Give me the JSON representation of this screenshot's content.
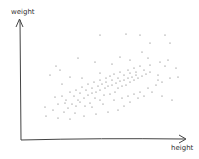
{
  "chart_data": {
    "type": "scatter",
    "title": "",
    "xlabel": "height",
    "ylabel": "weight",
    "grid": false,
    "legend": null,
    "style": "hand-drawn sketch",
    "trend": "positive correlation",
    "points": [
      [
        60,
        70
      ],
      [
        70,
        77
      ],
      [
        62,
        84
      ],
      [
        50,
        75
      ],
      [
        82,
        78
      ],
      [
        100,
        73
      ],
      [
        120,
        57
      ],
      [
        142,
        52
      ],
      [
        158,
        75
      ],
      [
        158,
        80
      ],
      [
        178,
        77
      ],
      [
        140,
        35
      ],
      [
        165,
        35
      ],
      [
        126,
        34
      ],
      [
        150,
        43
      ],
      [
        170,
        43
      ],
      [
        100,
        35
      ],
      [
        45,
        107
      ],
      [
        53,
        110
      ],
      [
        64,
        112
      ],
      [
        75,
        113
      ],
      [
        68,
        108
      ],
      [
        80,
        102
      ],
      [
        85,
        106
      ],
      [
        90,
        103
      ],
      [
        95,
        98
      ],
      [
        100,
        100
      ],
      [
        104,
        95
      ],
      [
        110,
        94
      ],
      [
        115,
        92
      ],
      [
        118,
        88
      ],
      [
        122,
        86
      ],
      [
        126,
        85
      ],
      [
        130,
        82
      ],
      [
        134,
        80
      ],
      [
        138,
        78
      ],
      [
        142,
        76
      ],
      [
        146,
        74
      ],
      [
        150,
        72
      ],
      [
        72,
        104
      ],
      [
        78,
        100
      ],
      [
        84,
        98
      ],
      [
        88,
        95
      ],
      [
        92,
        93
      ],
      [
        96,
        92
      ],
      [
        100,
        90
      ],
      [
        105,
        88
      ],
      [
        108,
        86
      ],
      [
        112,
        85
      ],
      [
        116,
        83
      ],
      [
        120,
        81
      ],
      [
        124,
        80
      ],
      [
        128,
        78
      ],
      [
        132,
        77
      ],
      [
        136,
        75
      ],
      [
        66,
        100
      ],
      [
        74,
        96
      ],
      [
        80,
        93
      ],
      [
        86,
        90
      ],
      [
        92,
        88
      ],
      [
        98,
        86
      ],
      [
        102,
        84
      ],
      [
        106,
        82
      ],
      [
        112,
        80
      ],
      [
        118,
        78
      ],
      [
        124,
        75
      ],
      [
        130,
        73
      ],
      [
        136,
        72
      ],
      [
        144,
        70
      ],
      [
        58,
        104
      ],
      [
        62,
        96
      ],
      [
        70,
        92
      ],
      [
        76,
        90
      ],
      [
        82,
        87
      ],
      [
        88,
        84
      ],
      [
        94,
        82
      ],
      [
        100,
        80
      ],
      [
        106,
        78
      ],
      [
        110,
        76
      ],
      [
        114,
        74
      ],
      [
        120,
        72
      ],
      [
        128,
        70
      ],
      [
        134,
        68
      ],
      [
        140,
        66
      ],
      [
        150,
        65
      ],
      [
        160,
        62
      ],
      [
        168,
        60
      ],
      [
        55,
        97
      ],
      [
        65,
        103
      ],
      [
        76,
        106
      ],
      [
        92,
        107
      ],
      [
        103,
        104
      ],
      [
        114,
        100
      ],
      [
        122,
        98
      ],
      [
        128,
        96
      ],
      [
        134,
        94
      ],
      [
        140,
        92
      ],
      [
        148,
        88
      ],
      [
        156,
        85
      ],
      [
        162,
        82
      ],
      [
        170,
        78
      ],
      [
        46,
        116
      ],
      [
        58,
        118
      ],
      [
        70,
        119
      ],
      [
        84,
        116
      ],
      [
        96,
        114
      ],
      [
        108,
        112
      ],
      [
        118,
        110
      ],
      [
        124,
        106
      ],
      [
        130,
        102
      ],
      [
        138,
        98
      ],
      [
        144,
        96
      ],
      [
        152,
        92
      ],
      [
        162,
        96
      ],
      [
        172,
        100
      ],
      [
        56,
        66
      ],
      [
        78,
        58
      ],
      [
        95,
        62
      ],
      [
        112,
        64
      ],
      [
        130,
        60
      ],
      [
        148,
        58
      ],
      [
        165,
        66
      ],
      [
        176,
        68
      ]
    ]
  }
}
